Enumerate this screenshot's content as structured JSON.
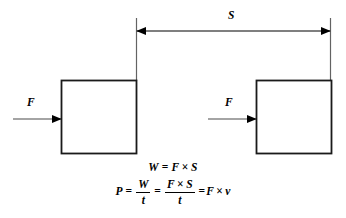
{
  "diagram": {
    "type": "physics-schematic",
    "background_color": "#ffffff",
    "line_color": "#000000",
    "thin_line_color": "#5a5a5a",
    "labels": {
      "displacement": "S",
      "force_left": "F",
      "force_right": "F"
    },
    "boxes": [
      {
        "name": "block-start",
        "x": 61,
        "y": 80,
        "width": 75,
        "height": 73
      },
      {
        "name": "block-end",
        "x": 256,
        "y": 80,
        "width": 75,
        "height": 73
      }
    ],
    "dimension_line": {
      "name": "displacement-dimension",
      "y": 31,
      "x_start": 136,
      "x_end": 331,
      "style": "double-headed-arrow"
    },
    "extension_lines": [
      {
        "x": 136,
        "y_top": 18,
        "y_bottom": 80
      },
      {
        "x": 331,
        "y_top": 18,
        "y_bottom": 80
      }
    ],
    "force_arrows": [
      {
        "name": "force-arrow-left",
        "y": 119,
        "x_start": 13,
        "x_end": 61
      },
      {
        "name": "force-arrow-right",
        "y": 119,
        "x_start": 208,
        "x_end": 256
      }
    ]
  },
  "formulas": {
    "work": {
      "lhs": "W",
      "equals": "=",
      "force": "F",
      "times": "×",
      "displacement": "S"
    },
    "power": {
      "lhs": "P",
      "equals1": "=",
      "frac1_num": "W",
      "frac1_den": "t",
      "equals2": "=",
      "frac2_num_force": "F",
      "frac2_num_times": "×",
      "frac2_num_displacement": "S",
      "frac2_den": "t",
      "equals3": "=",
      "result_force": "F",
      "result_times": "×",
      "result_velocity": "v"
    }
  }
}
